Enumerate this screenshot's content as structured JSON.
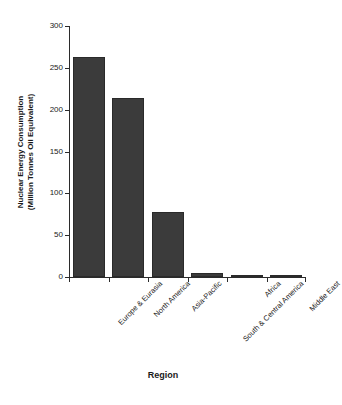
{
  "chart_data": {
    "type": "bar",
    "title": "",
    "subtitle": "",
    "xlabel": "Region",
    "ylabel": "Nuclear Energy Consumption (Million Tonnes Oil Equivalent)",
    "ylabel_line1": "Nuclear Energy Consumption",
    "ylabel_line2": "(Million Tonnes Oil Equivalent)",
    "categories": [
      "Europe & Eurasia",
      "North America",
      "Asia-Pacific",
      "South & Central America",
      "Africa",
      "Middle East"
    ],
    "values": [
      263,
      214,
      78,
      5,
      3,
      1
    ],
    "series": [
      {
        "name": "Nuclear Energy Consumption",
        "values": [
          263,
          214,
          78,
          5,
          3,
          1
        ]
      }
    ],
    "ylim": [
      0,
      300
    ],
    "yticks": [
      0,
      50,
      100,
      150,
      200,
      250,
      300
    ],
    "ytick_labels": [
      "0",
      "50",
      "100",
      "150",
      "200",
      "250",
      "300"
    ],
    "grid": false,
    "legend": false,
    "legend_position": "none",
    "bar_color": "#3b3b3b",
    "axis_color": "#2b2b2b",
    "background_color": "#ffffff"
  }
}
